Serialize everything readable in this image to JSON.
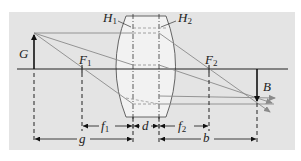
{
  "diagram": {
    "type": "thick-lens-imaging",
    "colors": {
      "panel": "#e6e6e6",
      "axis": "#222222",
      "ray": "#8a8a8a",
      "lens_fill": "#f3f3f3",
      "lens_edge": "#555555",
      "dashed": "#333333"
    },
    "labels": {
      "object": "G",
      "image": "B",
      "principal_plane_1": "H",
      "principal_plane_1_sub": "1",
      "principal_plane_2": "H",
      "principal_plane_2_sub": "2",
      "focal_point_1": "F",
      "focal_point_1_sub": "1",
      "focal_point_2": "F",
      "focal_point_2_sub": "2",
      "dim_f1": "f",
      "dim_f1_sub": "1",
      "dim_d": "d",
      "dim_f2": "f",
      "dim_f2_sub": "2",
      "dim_g": "g",
      "dim_b": "b"
    }
  }
}
